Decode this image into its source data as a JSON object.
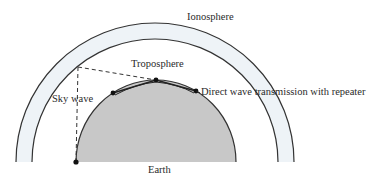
{
  "diagram": {
    "type": "radio wave propagation",
    "labels": {
      "ionosphere": "Ionosphere",
      "troposphere": "Troposphere",
      "sky_wave": "Sky wave",
      "direct_wave": "Direct wave transmission with repeater",
      "earth": "Earth"
    },
    "colors": {
      "earth_fill": "#c8c8c8",
      "ionosphere_fill": "#eef3f7",
      "line": "#333333",
      "background": "#ffffff"
    },
    "repeater_count": 3
  }
}
